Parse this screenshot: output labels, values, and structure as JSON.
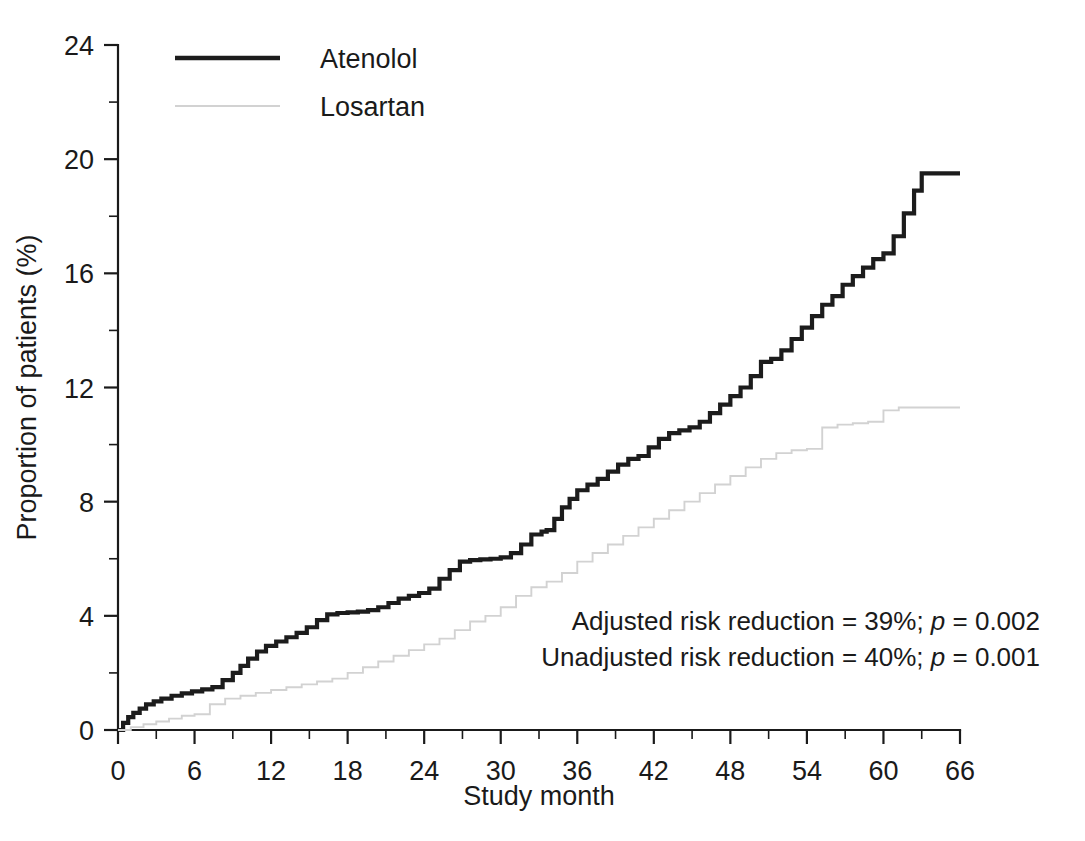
{
  "chart_data": {
    "type": "line",
    "title": "",
    "subtitle": "",
    "xlabel": "Study month",
    "ylabel": "Proportion of patients (%)",
    "xlim": [
      0,
      66
    ],
    "ylim": [
      0,
      24
    ],
    "x_ticks": [
      0,
      6,
      12,
      18,
      24,
      30,
      36,
      42,
      48,
      54,
      60,
      66
    ],
    "x_tick_labels": [
      "0",
      "6",
      "12",
      "18",
      "24",
      "30",
      "36",
      "42",
      "48",
      "54",
      "60",
      "66"
    ],
    "x_minor_ticks": [
      3,
      9,
      15,
      21,
      27,
      33,
      39,
      45,
      51,
      57,
      63
    ],
    "y_ticks": [
      0,
      4,
      8,
      12,
      16,
      20,
      24
    ],
    "y_tick_labels": [
      "0",
      "4",
      "8",
      "12",
      "16",
      "20",
      "24"
    ],
    "y_minor_ticks": [
      2,
      6,
      10,
      14,
      18,
      22
    ],
    "grid": false,
    "legend_position": "top-left",
    "step_type": "post",
    "series": [
      {
        "name": "Atenolol",
        "color": "#1c1c1c",
        "line_width": 4.2,
        "x": [
          0,
          0.4,
          0.8,
          1.2,
          1.7,
          2.2,
          2.8,
          3.4,
          4.2,
          5.0,
          5.8,
          6.6,
          7.4,
          8.2,
          9.0,
          9.6,
          10.2,
          10.9,
          11.6,
          12.4,
          13.2,
          14.0,
          14.8,
          15.6,
          16.4,
          17.2,
          18.0,
          18.8,
          19.6,
          20.4,
          21.2,
          22.0,
          22.8,
          23.6,
          24.4,
          25.2,
          26.0,
          26.8,
          27.6,
          28.4,
          29.2,
          30.0,
          30.8,
          31.6,
          32.4,
          33.2,
          33.6,
          34.2,
          34.8,
          35.4,
          36.0,
          36.8,
          37.6,
          38.4,
          39.2,
          40.0,
          40.8,
          41.6,
          42.4,
          43.2,
          44.0,
          44.8,
          45.6,
          46.4,
          47.2,
          48.0,
          48.8,
          49.6,
          50.4,
          51.2,
          52.0,
          52.8,
          53.6,
          54.4,
          55.2,
          56.0,
          56.8,
          57.6,
          58.4,
          59.2,
          60.0,
          60.8,
          61.6,
          62.4,
          63.0,
          66.0
        ],
        "y": [
          0,
          0.25,
          0.45,
          0.6,
          0.75,
          0.9,
          1.0,
          1.1,
          1.2,
          1.28,
          1.35,
          1.42,
          1.5,
          1.75,
          2.0,
          2.25,
          2.5,
          2.75,
          2.95,
          3.1,
          3.25,
          3.4,
          3.6,
          3.85,
          4.05,
          4.1,
          4.12,
          4.15,
          4.2,
          4.3,
          4.45,
          4.6,
          4.7,
          4.8,
          4.95,
          5.3,
          5.6,
          5.9,
          5.95,
          5.98,
          6.0,
          6.05,
          6.2,
          6.5,
          6.85,
          6.95,
          7.0,
          7.4,
          7.8,
          8.1,
          8.4,
          8.6,
          8.8,
          9.05,
          9.3,
          9.5,
          9.6,
          9.9,
          10.2,
          10.4,
          10.5,
          10.6,
          10.8,
          11.1,
          11.4,
          11.7,
          12.0,
          12.4,
          12.9,
          13.0,
          13.3,
          13.7,
          14.1,
          14.5,
          14.9,
          15.2,
          15.6,
          15.9,
          16.2,
          16.5,
          16.7,
          17.3,
          18.1,
          18.9,
          19.5,
          19.5
        ],
        "end_value": 19.5
      },
      {
        "name": "Losartan",
        "color": "#d2d2d2",
        "line_width": 1.9,
        "x": [
          0,
          1.0,
          2.0,
          3.0,
          4.0,
          5.0,
          6.0,
          7.2,
          8.4,
          9.6,
          10.8,
          12.0,
          13.2,
          14.4,
          15.6,
          16.8,
          18.0,
          19.2,
          20.4,
          21.6,
          22.8,
          24.0,
          25.2,
          26.4,
          27.6,
          28.8,
          30.0,
          31.2,
          32.4,
          33.6,
          34.8,
          36.0,
          37.2,
          38.4,
          39.6,
          40.8,
          42.0,
          43.2,
          44.4,
          45.6,
          46.8,
          48.0,
          49.2,
          50.4,
          51.6,
          52.8,
          54.0,
          55.2,
          56.4,
          57.6,
          58.8,
          60.0,
          61.2,
          62.4,
          63.6,
          66.0
        ],
        "y": [
          0,
          0.1,
          0.2,
          0.3,
          0.4,
          0.5,
          0.55,
          0.9,
          1.1,
          1.2,
          1.3,
          1.4,
          1.5,
          1.6,
          1.7,
          1.8,
          2.0,
          2.2,
          2.4,
          2.6,
          2.8,
          3.0,
          3.2,
          3.5,
          3.8,
          4.0,
          4.3,
          4.7,
          5.0,
          5.2,
          5.5,
          5.9,
          6.2,
          6.5,
          6.8,
          7.1,
          7.4,
          7.7,
          8.0,
          8.3,
          8.6,
          8.9,
          9.2,
          9.5,
          9.7,
          9.8,
          9.85,
          10.6,
          10.7,
          10.75,
          10.8,
          11.2,
          11.3,
          11.3,
          11.3,
          11.3
        ],
        "end_value": 11.3
      }
    ],
    "annotations": [
      {
        "id": "adjusted-risk",
        "prefix": "Adjusted risk reduction = 39%; ",
        "italic": "p",
        "suffix": " = 0.002"
      },
      {
        "id": "unadjusted-risk",
        "prefix": "Unadjusted risk reduction = 40%; ",
        "italic": "p",
        "suffix": " = 0.001"
      }
    ]
  },
  "legend": {
    "items": [
      {
        "label": "Atenolol",
        "color": "#1c1c1c"
      },
      {
        "label": "Losartan",
        "color": "#d2d2d2"
      }
    ]
  },
  "colors": {
    "background": "#ffffff",
    "axis": "#1a1a1a",
    "atenolol": "#1c1c1c",
    "losartan": "#d2d2d2",
    "text": "#1a1a1a"
  }
}
